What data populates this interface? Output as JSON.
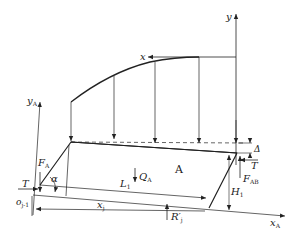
{
  "diagram": {
    "labels": {
      "y": "y",
      "x": "x",
      "yA": "y",
      "yA_sub": "A",
      "xA": "x",
      "xA_sub": "A",
      "FA": "F",
      "FA_sub": "A",
      "alpha": "α",
      "T_left": "T",
      "oj1": "o",
      "oj1_sub": "j-1",
      "L1": "L",
      "L1_sub": "1",
      "QA": "Q",
      "QA_sub": "A",
      "A": "A",
      "xj": "x",
      "xj_sub": "j",
      "Rj": "R′",
      "Rj_sub": "j",
      "Delta": "Δ",
      "T_right": "T",
      "FAB": "F",
      "FAB_sub": "AB",
      "H1": "H",
      "H1_sub": "1"
    }
  }
}
